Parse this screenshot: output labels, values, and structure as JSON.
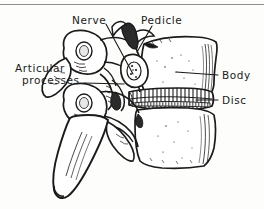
{
  "figure": {
    "style": "hand-drawn pen-and-ink anatomical line illustration",
    "background_color": "#fdfdfb",
    "ink_color": "#1a1a1a",
    "rule_color": "#8e8e8e"
  },
  "labels": {
    "nerve": "Nerve",
    "pedicle": "Pedicle",
    "articular_line1": "Articular",
    "articular_line2": "processes",
    "body": "Body",
    "disc": "Disc"
  }
}
